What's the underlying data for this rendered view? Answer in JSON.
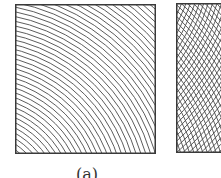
{
  "figure": {
    "panels": [
      {
        "id": "a",
        "label": "(a)",
        "pattern": "concentric-arcs",
        "line_count": 44
      },
      {
        "id": "b",
        "label": "",
        "pattern": "moire-crosshatch"
      }
    ]
  },
  "colors": {
    "stroke": "#4a4a4a",
    "frame": "#3a3a3a",
    "background": "#ffffff"
  }
}
